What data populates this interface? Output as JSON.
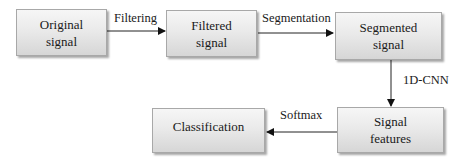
{
  "diagram": {
    "type": "flowchart",
    "nodes": [
      {
        "id": "original",
        "line1": "Original",
        "line2": "signal"
      },
      {
        "id": "filtered",
        "line1": "Filtered",
        "line2": "signal"
      },
      {
        "id": "segmented",
        "line1": "Segmented",
        "line2": "signal"
      },
      {
        "id": "features",
        "line1": "Signal",
        "line2": "features"
      },
      {
        "id": "classification",
        "line1": "Classification",
        "line2": ""
      }
    ],
    "edges": [
      {
        "from": "original",
        "to": "filtered",
        "label": "Filtering"
      },
      {
        "from": "filtered",
        "to": "segmented",
        "label": "Segmentation"
      },
      {
        "from": "segmented",
        "to": "features",
        "label": "1D-CNN"
      },
      {
        "from": "features",
        "to": "classification",
        "label": "Softmax"
      }
    ]
  }
}
